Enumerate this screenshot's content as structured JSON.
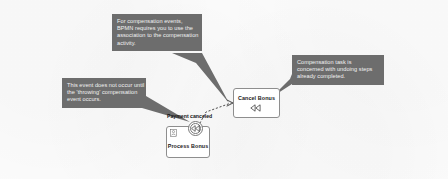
{
  "diagram": {
    "kind": "bpmn-compensation-example",
    "background_color": "#fbfbfb",
    "callout_color": "#6d6d6d",
    "callout_text_color": "#f2f2f2",
    "node_border_color": "#8e8e8e"
  },
  "annotations": [
    {
      "id": "compensation-association-note",
      "lines": [
        "For compensation events,",
        "BPMN requires you to use the",
        "association to the compensation",
        "activity."
      ]
    },
    {
      "id": "throwing-event-note",
      "lines": [
        "This event does not occur until",
        "the 'throwing' compensation",
        "event occurs."
      ]
    },
    {
      "id": "compensation-task-note",
      "lines": [
        "Compensation task is",
        "concerned with undoing steps",
        "already completed."
      ]
    }
  ],
  "nodes": {
    "process_bonus": {
      "label": "Process Bonus",
      "type": "user-task",
      "icon": "user-task-icon"
    },
    "cancel_bonus": {
      "label": "Cancel Bonus",
      "type": "compensation-task",
      "marker": "compensation-marker-icon"
    },
    "payment_canceled_event": {
      "label": "Payment canceled",
      "type": "boundary-compensation-event",
      "marker": "compensation-marker-icon"
    }
  },
  "connections": [
    {
      "id": "compensation-association",
      "from": "payment_canceled_event",
      "to": "cancel_bonus",
      "style": "dotted",
      "arrowhead": "open"
    }
  ]
}
